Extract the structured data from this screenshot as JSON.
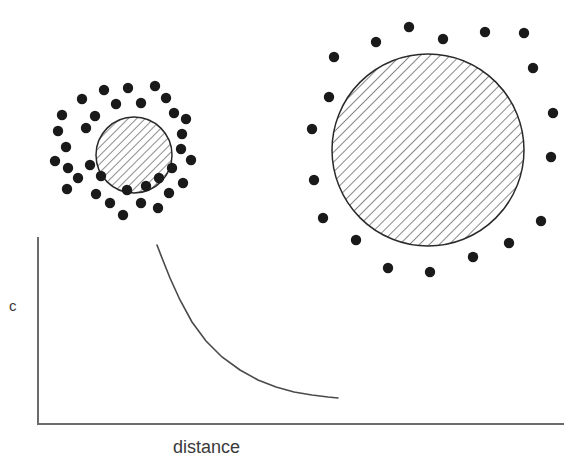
{
  "figure": {
    "caption_title": "",
    "background_color": "#ffffff",
    "width": 583,
    "height": 469
  },
  "axes": {
    "y_label": "c",
    "x_label": "distance",
    "line_color": "#6b6b6b",
    "origin_x": 38,
    "origin_y": 424,
    "y_top": 238,
    "x_right": 563,
    "stroke_width": 2
  },
  "chart_data": {
    "type": "line",
    "title": "",
    "xlabel": "distance",
    "ylabel": "c",
    "grid": false,
    "legend": "none",
    "series": [
      {
        "name": "concentration decay",
        "color": "#4a4a4a",
        "x": [
          157,
          162,
          170,
          180,
          192,
          206,
          222,
          240,
          258,
          276,
          294,
          312,
          328,
          338
        ],
        "y": [
          245,
          258,
          278,
          300,
          322,
          341,
          357,
          370,
          380,
          387,
          392,
          395,
          397,
          398
        ]
      }
    ],
    "xlim": [
      38,
      563
    ],
    "ylim": [
      424,
      238
    ]
  },
  "particles": {
    "dot_color": "#1a1a1a",
    "small_dot_radius": 5.2,
    "large_dot_radius": 5.2
  },
  "small_cluster": {
    "label": "small-particle-with-dense-halo",
    "circle": {
      "cx": 134,
      "cy": 155,
      "r": 38,
      "stroke": "#2a2a2a",
      "hatch": "diagonal-45"
    },
    "dots": [
      [
        104,
        90
      ],
      [
        128,
        88
      ],
      [
        155,
        86
      ],
      [
        82,
        99
      ],
      [
        116,
        104
      ],
      [
        141,
        103
      ],
      [
        166,
        98
      ],
      [
        62,
        115
      ],
      [
        95,
        116
      ],
      [
        174,
        113
      ],
      [
        58,
        131
      ],
      [
        86,
        128
      ],
      [
        186,
        119
      ],
      [
        66,
        147
      ],
      [
        182,
        134
      ],
      [
        55,
        161
      ],
      [
        181,
        149
      ],
      [
        68,
        168
      ],
      [
        90,
        165
      ],
      [
        78,
        178
      ],
      [
        191,
        160
      ],
      [
        101,
        176
      ],
      [
        172,
        168
      ],
      [
        159,
        178
      ],
      [
        67,
        189
      ],
      [
        96,
        194
      ],
      [
        127,
        190
      ],
      [
        146,
        186
      ],
      [
        110,
        203
      ],
      [
        141,
        203
      ],
      [
        169,
        193
      ],
      [
        123,
        215
      ],
      [
        158,
        208
      ],
      [
        183,
        183
      ]
    ]
  },
  "large_cluster": {
    "label": "large-particle-with-sparse-halo",
    "circle": {
      "cx": 428,
      "cy": 150,
      "r": 96,
      "stroke": "#2a2a2a",
      "hatch": "diagonal-45"
    },
    "dots": [
      [
        409,
        27
      ],
      [
        443,
        39
      ],
      [
        485,
        32
      ],
      [
        524,
        33
      ],
      [
        376,
        42
      ],
      [
        334,
        57
      ],
      [
        533,
        68
      ],
      [
        329,
        97
      ],
      [
        553,
        113
      ],
      [
        312,
        129
      ],
      [
        551,
        157
      ],
      [
        314,
        180
      ],
      [
        323,
        218
      ],
      [
        541,
        221
      ],
      [
        356,
        240
      ],
      [
        388,
        268
      ],
      [
        430,
        272
      ],
      [
        473,
        257
      ],
      [
        509,
        243
      ]
    ]
  }
}
